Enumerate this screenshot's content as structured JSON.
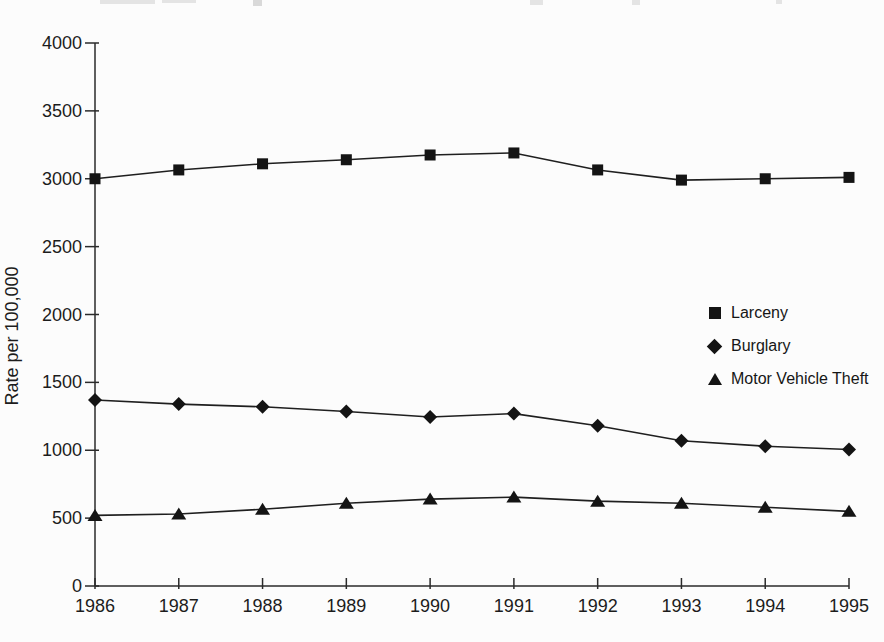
{
  "chart_data": {
    "type": "line",
    "title": "",
    "xlabel": "",
    "ylabel": "Rate per 100,000",
    "categories": [
      "1986",
      "1987",
      "1988",
      "1989",
      "1990",
      "1991",
      "1992",
      "1993",
      "1994",
      "1995"
    ],
    "yticks": [
      0,
      500,
      1000,
      1500,
      2000,
      2500,
      3000,
      3500,
      4000
    ],
    "ylim": [
      0,
      4000
    ],
    "grid": false,
    "legend_position": "center-right",
    "axis_color": "#2b2b2b",
    "line_color": "#1f1f1f",
    "marker_color": "#141414",
    "background": "#fcfcfc",
    "series": [
      {
        "name": "Larceny",
        "marker": "square",
        "values": [
          3000,
          3065,
          3110,
          3140,
          3175,
          3190,
          3065,
          2990,
          3000,
          3010
        ]
      },
      {
        "name": "Burglary",
        "marker": "diamond",
        "values": [
          1370,
          1340,
          1320,
          1285,
          1245,
          1270,
          1180,
          1070,
          1030,
          1005
        ]
      },
      {
        "name": "Motor Vehicle Theft",
        "marker": "triangle",
        "values": [
          520,
          530,
          565,
          610,
          640,
          655,
          625,
          610,
          580,
          550
        ]
      }
    ]
  }
}
